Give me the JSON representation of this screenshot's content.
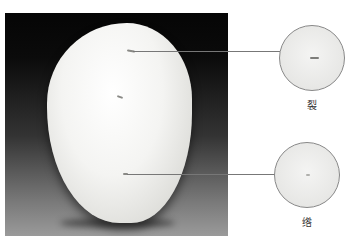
{
  "figure": {
    "annotations": [
      {
        "id": "crack",
        "label": "裂",
        "description": "crack detail magnified"
      },
      {
        "id": "vein",
        "label": "绺",
        "description": "fine fissure detail magnified"
      }
    ]
  }
}
